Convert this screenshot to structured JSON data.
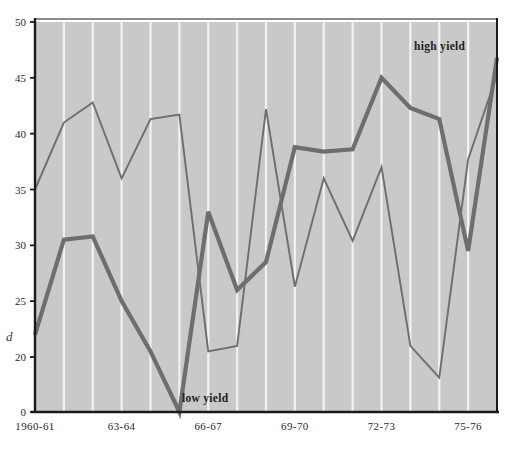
{
  "figure": {
    "background": "#ffffff",
    "plot_background": "#c9c9c9",
    "gridline_color": "#f2f2f2",
    "axis_color": "#1a1a1a",
    "series_color": "#6e6e6e",
    "y_axis_title": "d"
  },
  "labels": {
    "high_yield": "high yield",
    "low_yield": "low yield"
  },
  "chart_data": {
    "type": "line",
    "title": "",
    "xlabel": "",
    "ylabel": "d",
    "grid": "vertical-only",
    "legend": "inline-annotations",
    "ylim": [
      0,
      50
    ],
    "yticks": [
      0,
      20,
      25,
      30,
      35,
      40,
      45,
      50
    ],
    "ytick_labels": [
      "0",
      "20",
      "25",
      "30",
      "35",
      "40",
      "45",
      "50"
    ],
    "y_axis_note": "scale compressed between 0 and 20 (axis break)",
    "categories": [
      "1960-61",
      "61-62",
      "62-63",
      "63-64",
      "64-65",
      "65-66",
      "66-67",
      "67-68",
      "68-69",
      "69-70",
      "70-71",
      "71-72",
      "72-73",
      "73-74",
      "74-75",
      "75-76",
      "76-77"
    ],
    "xtick_labels": [
      "1960-61",
      "63-64",
      "66-67",
      "69-70",
      "72-73",
      "75-76"
    ],
    "xtick_categories": [
      "1960-61",
      "63-64",
      "66-67",
      "69-70",
      "72-73",
      "75-76"
    ],
    "series": [
      {
        "name": "high yield",
        "style": "thick",
        "values": [
          22.0,
          30.5,
          30.8,
          25.0,
          20.5,
          0.0,
          33.0,
          26.0,
          28.5,
          38.8,
          38.4,
          38.6,
          45.0,
          42.3,
          41.3,
          29.5,
          46.8
        ]
      },
      {
        "name": "low yield",
        "style": "thin",
        "values": [
          35.0,
          41.0,
          42.8,
          36.0,
          41.3,
          41.7,
          20.5,
          21.0,
          42.2,
          26.3,
          36.0,
          30.4,
          37.0,
          21.0,
          12.5,
          37.7,
          45.3
        ]
      }
    ]
  }
}
